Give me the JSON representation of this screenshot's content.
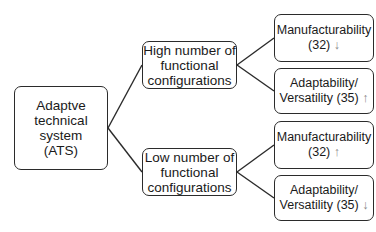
{
  "diagram": {
    "type": "tree",
    "root": {
      "label_lines": [
        "Adaptve",
        "technical",
        "system",
        "(ATS)"
      ]
    },
    "branches": [
      {
        "label_lines": [
          "High number of",
          "functional",
          "configurations"
        ],
        "leaves": [
          {
            "line1": "Manufacturability",
            "line2": "(32)",
            "arrow": "↓",
            "arrow_meaning": "decrease"
          },
          {
            "line1": "Adaptability/",
            "line2": "Versatility (35)",
            "arrow": "↑",
            "arrow_meaning": "increase"
          }
        ]
      },
      {
        "label_lines": [
          "Low number of",
          "functional",
          "configurations"
        ],
        "leaves": [
          {
            "line1": "Manufacturability",
            "line2": "(32)",
            "arrow": "↑",
            "arrow_meaning": "increase"
          },
          {
            "line1": "Adaptability/",
            "line2": "Versatility (35)",
            "arrow": "↓",
            "arrow_meaning": "decrease"
          }
        ]
      }
    ]
  },
  "colors": {
    "border": "#2b2b2b",
    "text": "#1a1a1a",
    "arrow": "#8a8a8a",
    "background": "#ffffff"
  }
}
